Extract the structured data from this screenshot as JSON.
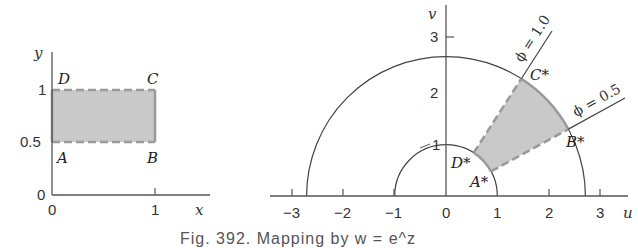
{
  "left_plot": {
    "x_axis_label": "x",
    "y_axis_label": "y",
    "x_ticks": [
      "0",
      "1"
    ],
    "y_ticks": [
      "0",
      "0.5",
      "1"
    ],
    "points": {
      "A": "A",
      "B": "B",
      "C": "C",
      "D": "D"
    },
    "region": {
      "x": [
        0,
        1
      ],
      "y": [
        0.5,
        1
      ]
    }
  },
  "right_plot": {
    "u_axis_label": "u",
    "v_axis_label": "v",
    "u_ticks": [
      "−3",
      "−2",
      "−1",
      "0",
      "1",
      "2",
      "3"
    ],
    "v_ticks": [
      "1",
      "2",
      "3"
    ],
    "points": {
      "A": "A*",
      "B": "B*",
      "C": "C*",
      "D": "D*"
    },
    "rays": [
      {
        "label": "ϕ = 1.0",
        "angle": 1.0
      },
      {
        "label": "ϕ = 0.5",
        "angle": 0.5
      }
    ],
    "circles": [
      {
        "radius": 1
      },
      {
        "radius": 2.718
      }
    ]
  },
  "caption": "Fig. 392.   Mapping by w = e^z"
}
